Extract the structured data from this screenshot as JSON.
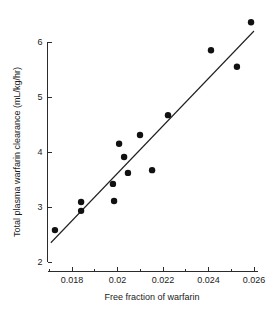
{
  "chart_data": {
    "type": "scatter",
    "title": "",
    "xlabel": "Free fraction of warfarin",
    "ylabel": "Total plasma warfarin clearance (mL/kg/hr)",
    "xlim": [
      0.0169,
      0.0263
    ],
    "ylim": [
      2,
      6.45
    ],
    "grid": false,
    "legend": null,
    "x_ticks": [
      0.018,
      0.02,
      0.022,
      0.024,
      0.026
    ],
    "x_tick_labels": [
      "0.018",
      "0.02",
      "0.022",
      "0.024",
      "0.026"
    ],
    "x_minor_ticks": [
      0.017,
      0.019,
      0.021,
      0.023,
      0.025
    ],
    "y_ticks": [
      2,
      3,
      4,
      5,
      6
    ],
    "y_tick_labels": [
      "2",
      "3",
      "4",
      "5",
      "6"
    ],
    "marker": "filled-circle",
    "marker_color": "#111111",
    "x": [
      0.01725,
      0.0184,
      0.0184,
      0.0198,
      0.01985,
      0.02007,
      0.02029,
      0.02046,
      0.02099,
      0.02152,
      0.02222,
      0.02411,
      0.02525,
      0.02587
    ],
    "y": [
      2.58,
      3.09,
      2.93,
      3.42,
      3.11,
      4.15,
      3.91,
      3.62,
      4.31,
      3.67,
      4.67,
      5.85,
      5.55,
      6.36
    ],
    "points": [
      {
        "x": 0.01725,
        "y": 2.58
      },
      {
        "x": 0.0184,
        "y": 3.09
      },
      {
        "x": 0.0184,
        "y": 2.93
      },
      {
        "x": 0.0198,
        "y": 3.42
      },
      {
        "x": 0.01985,
        "y": 3.11
      },
      {
        "x": 0.02007,
        "y": 4.15
      },
      {
        "x": 0.02029,
        "y": 3.91
      },
      {
        "x": 0.02046,
        "y": 3.62
      },
      {
        "x": 0.02099,
        "y": 4.31
      },
      {
        "x": 0.02152,
        "y": 3.67
      },
      {
        "x": 0.02222,
        "y": 4.67
      },
      {
        "x": 0.02411,
        "y": 5.85
      },
      {
        "x": 0.02525,
        "y": 5.55
      },
      {
        "x": 0.02587,
        "y": 6.36
      }
    ],
    "fit_line": {
      "type": "linear-regression",
      "x_start": 0.01707,
      "y_start": 2.35,
      "x_end": 0.026,
      "y_end": 6.2,
      "color": "#1f1f1f"
    }
  }
}
